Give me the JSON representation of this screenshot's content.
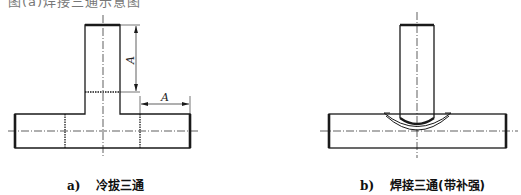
{
  "header": {
    "cropped_text": "图(a)焊接三通示意图"
  },
  "figures": [
    {
      "id": "a",
      "label": "a)",
      "title": "冷拔三通",
      "dimensions": [
        {
          "name": "branch-length",
          "symbol": "A"
        },
        {
          "name": "run-end-length",
          "symbol": "A"
        }
      ]
    },
    {
      "id": "b",
      "label": "b)",
      "title": "焊接三通(带补强)"
    }
  ],
  "colors": {
    "line": "#1a1a1a",
    "background": "#ffffff"
  }
}
